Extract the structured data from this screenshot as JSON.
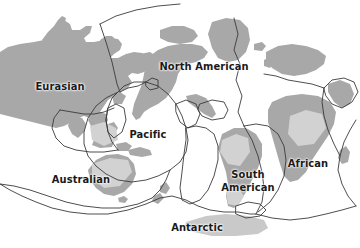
{
  "map": {
    "title": "Tectonic Plates of the World",
    "width": 360,
    "height": 248,
    "background_color": "#ffffff",
    "land_color": "#a8a8a8",
    "land_color_light": "#c9c9c9",
    "boundary_color": "#3a3a3a",
    "label_color": "#1a1a1a"
  },
  "labels": [
    {
      "id": "eurasian",
      "text": "Eurasian",
      "x": 60,
      "y": 87,
      "lines": 1
    },
    {
      "id": "north-american",
      "text": "North American",
      "x": 204,
      "y": 67,
      "lines": 1
    },
    {
      "id": "pacific",
      "text": "Pacific",
      "x": 148,
      "y": 135,
      "lines": 1
    },
    {
      "id": "australian",
      "text": "Australian",
      "x": 81,
      "y": 180,
      "lines": 1
    },
    {
      "id": "south-american",
      "text": "South\nAmerican",
      "x": 248,
      "y": 181,
      "lines": 2
    },
    {
      "id": "african",
      "text": "African",
      "x": 308,
      "y": 164,
      "lines": 1
    },
    {
      "id": "antarctic",
      "text": "Antarctic",
      "x": 197,
      "y": 228,
      "lines": 1
    }
  ]
}
